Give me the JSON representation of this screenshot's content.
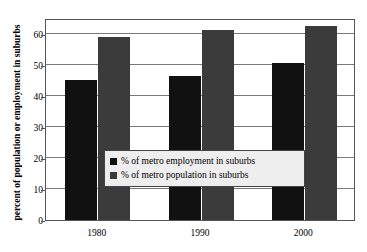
{
  "chart_data": {
    "type": "bar",
    "title": "",
    "xlabel": "",
    "ylabel": "percent of population or employment in suburbs",
    "categories": [
      "1980",
      "1990",
      "2000"
    ],
    "series": [
      {
        "name": "% of metro employment in suburbs",
        "color": "#111111",
        "values": [
          45,
          46.5,
          50.5
        ]
      },
      {
        "name": "% of metro population in suburbs",
        "color": "#3b3b3b",
        "values": [
          59,
          61,
          62.5
        ]
      }
    ],
    "ylim": [
      0,
      65
    ],
    "yticks": [
      0,
      10,
      20,
      30,
      40,
      50,
      60
    ],
    "ytick_labels": [
      "0",
      "10",
      "20",
      "30",
      "40",
      "50",
      "60"
    ],
    "grid": true,
    "grid_axis": "y",
    "legend_position": "center",
    "legend": [
      "% of metro employment in suburbs",
      "% of metro population in suburbs"
    ]
  }
}
